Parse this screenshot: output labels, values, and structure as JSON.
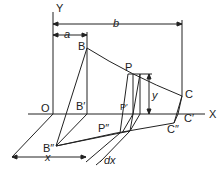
{
  "diagram": {
    "labels": {
      "y_axis": "Y",
      "x_axis": "X",
      "origin": "O",
      "a": "a",
      "b": "b",
      "B": "B",
      "B_prime": "B′",
      "B_double": "B″",
      "P": "P",
      "P_prime": "P′",
      "P_double": "P″",
      "C": "C",
      "C_prime": "C′",
      "C_double": "C″",
      "y": "y",
      "x": "x",
      "dx": "dx"
    },
    "stroke_color": "#222222"
  }
}
